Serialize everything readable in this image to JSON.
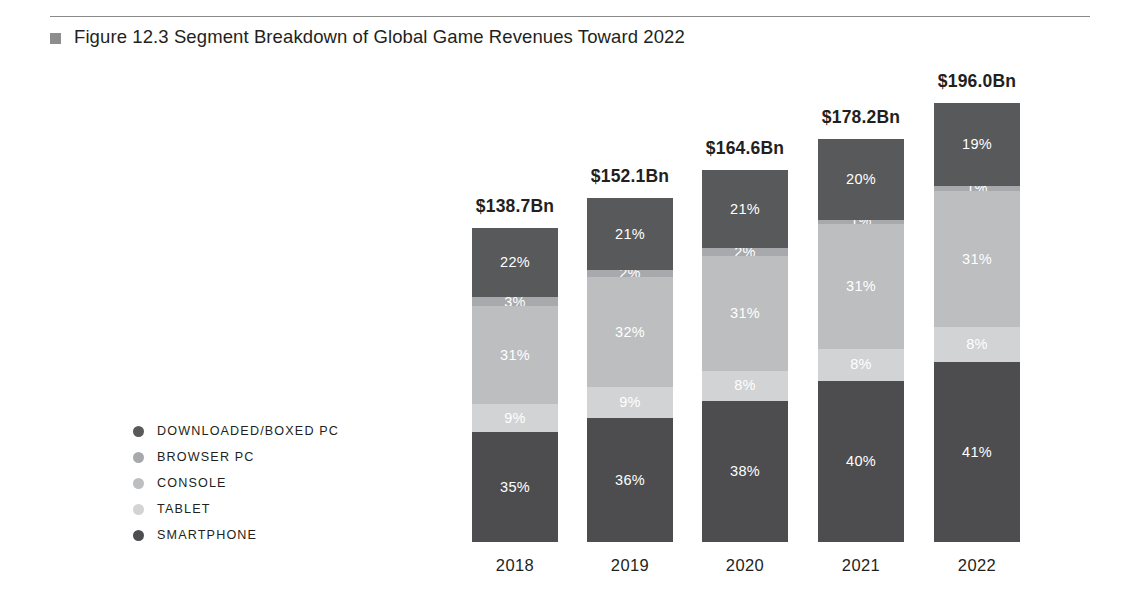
{
  "figure": {
    "marker": "square-marker",
    "title": "Figure 12.3  Segment Breakdown of Global Game Revenues Toward 2022"
  },
  "legend": {
    "items": [
      {
        "label": "DOWNLOADED/BOXED PC",
        "color": "#58595b"
      },
      {
        "label": "BROWSER PC",
        "color": "#a7a9ac"
      },
      {
        "label": "CONSOLE",
        "color": "#bcbec0"
      },
      {
        "label": "TABLET",
        "color": "#d1d3d4"
      },
      {
        "label": "SMARTPHONE",
        "color": "#4d4d4f"
      }
    ]
  },
  "chart_data": {
    "type": "bar",
    "subtype": "stacked-percent",
    "title": "Figure 12.3  Segment Breakdown of Global Game Revenues Toward 2022",
    "xlabel": "",
    "ylabel": "",
    "grid": false,
    "legend_position": "left",
    "categories": [
      "2018",
      "2019",
      "2020",
      "2021",
      "2022"
    ],
    "totals": [
      "$138.7Bn",
      "$152.1Bn",
      "$164.6Bn",
      "$178.2Bn",
      "$196.0Bn"
    ],
    "total_values": [
      138.7,
      152.1,
      164.6,
      178.2,
      196.0
    ],
    "total_unit": "Bn USD",
    "series": [
      {
        "name": "DOWNLOADED/BOXED PC",
        "color": "#58595b",
        "values": [
          22,
          21,
          21,
          20,
          19
        ],
        "labels": [
          "22%",
          "21%",
          "21%",
          "20%",
          "19%"
        ]
      },
      {
        "name": "BROWSER PC",
        "color": "#a7a9ac",
        "values": [
          3,
          2,
          2,
          1,
          1
        ],
        "labels": [
          "3%",
          "2%",
          "2%",
          "1%",
          "1%"
        ]
      },
      {
        "name": "CONSOLE",
        "color": "#bcbec0",
        "values": [
          31,
          32,
          31,
          31,
          31
        ],
        "labels": [
          "31%",
          "32%",
          "31%",
          "31%",
          "31%"
        ]
      },
      {
        "name": "TABLET",
        "color": "#d1d3d4",
        "values": [
          9,
          9,
          8,
          8,
          8
        ],
        "labels": [
          "9%",
          "9%",
          "8%",
          "8%",
          "8%"
        ]
      },
      {
        "name": "SMARTPHONE",
        "color": "#4d4d4f",
        "values": [
          35,
          36,
          38,
          40,
          41
        ],
        "labels": [
          "35%",
          "36%",
          "38%",
          "40%",
          "41%"
        ]
      }
    ],
    "bars": [
      {
        "category": "2018",
        "total": "$138.7Bn",
        "bar_height_px": 314,
        "segments": [
          {
            "name": "DOWNLOADED/BOXED PC",
            "label": "22%",
            "value": 22,
            "color": "#58595b"
          },
          {
            "name": "BROWSER PC",
            "label": "3%",
            "value": 3,
            "color": "#a7a9ac"
          },
          {
            "name": "CONSOLE",
            "label": "31%",
            "value": 31,
            "color": "#bcbec0"
          },
          {
            "name": "TABLET",
            "label": "9%",
            "value": 9,
            "color": "#d1d3d4"
          },
          {
            "name": "SMARTPHONE",
            "label": "35%",
            "value": 35,
            "color": "#4d4d4f"
          }
        ]
      },
      {
        "category": "2019",
        "total": "$152.1Bn",
        "bar_height_px": 344,
        "segments": [
          {
            "name": "DOWNLOADED/BOXED PC",
            "label": "21%",
            "value": 21,
            "color": "#58595b"
          },
          {
            "name": "BROWSER PC",
            "label": "2%",
            "value": 2,
            "color": "#a7a9ac"
          },
          {
            "name": "CONSOLE",
            "label": "32%",
            "value": 32,
            "color": "#bcbec0"
          },
          {
            "name": "TABLET",
            "label": "9%",
            "value": 9,
            "color": "#d1d3d4"
          },
          {
            "name": "SMARTPHONE",
            "label": "36%",
            "value": 36,
            "color": "#4d4d4f"
          }
        ]
      },
      {
        "category": "2020",
        "total": "$164.6Bn",
        "bar_height_px": 372,
        "segments": [
          {
            "name": "DOWNLOADED/BOXED PC",
            "label": "21%",
            "value": 21,
            "color": "#58595b"
          },
          {
            "name": "BROWSER PC",
            "label": "2%",
            "value": 2,
            "color": "#a7a9ac"
          },
          {
            "name": "CONSOLE",
            "label": "31%",
            "value": 31,
            "color": "#bcbec0"
          },
          {
            "name": "TABLET",
            "label": "8%",
            "value": 8,
            "color": "#d1d3d4"
          },
          {
            "name": "SMARTPHONE",
            "label": "38%",
            "value": 38,
            "color": "#4d4d4f"
          }
        ]
      },
      {
        "category": "2021",
        "total": "$178.2Bn",
        "bar_height_px": 403,
        "segments": [
          {
            "name": "DOWNLOADED/BOXED PC",
            "label": "20%",
            "value": 20,
            "color": "#58595b"
          },
          {
            "name": "BROWSER PC",
            "label": "1%",
            "value": 1,
            "color": "#a7a9ac"
          },
          {
            "name": "CONSOLE",
            "label": "31%",
            "value": 31,
            "color": "#bcbec0"
          },
          {
            "name": "TABLET",
            "label": "8%",
            "value": 8,
            "color": "#d1d3d4"
          },
          {
            "name": "SMARTPHONE",
            "label": "40%",
            "value": 40,
            "color": "#4d4d4f"
          }
        ]
      },
      {
        "category": "2022",
        "total": "$196.0Bn",
        "bar_height_px": 439,
        "segments": [
          {
            "name": "DOWNLOADED/BOXED PC",
            "label": "19%",
            "value": 19,
            "color": "#58595b"
          },
          {
            "name": "BROWSER PC",
            "label": "1%",
            "value": 1,
            "color": "#a7a9ac"
          },
          {
            "name": "CONSOLE",
            "label": "31%",
            "value": 31,
            "color": "#bcbec0"
          },
          {
            "name": "TABLET",
            "label": "8%",
            "value": 8,
            "color": "#d1d3d4"
          },
          {
            "name": "SMARTPHONE",
            "label": "41%",
            "value": 41,
            "color": "#4d4d4f"
          }
        ]
      }
    ]
  },
  "layout": {
    "bar_left_positions_px": [
      472,
      587,
      702,
      818,
      934
    ],
    "bar_width_px": 86,
    "baseline_y_px": 542,
    "x_label_y_px": 556
  }
}
